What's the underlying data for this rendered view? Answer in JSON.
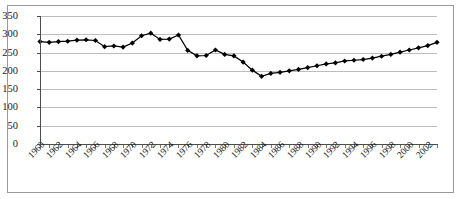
{
  "chart_data": {
    "type": "line",
    "title": "",
    "subtitle": "",
    "xlabel": "",
    "ylabel": "",
    "xlim": [
      1960,
      2003
    ],
    "ylim": [
      0,
      350
    ],
    "grid": true,
    "legend": false,
    "legend_position": "none",
    "marker": "diamond",
    "marker_color": "#000000",
    "line_color": "#000000",
    "ytick_labels": [
      "0",
      "50",
      "100",
      "150",
      "200",
      "250",
      "300",
      "350"
    ],
    "ytick_values": [
      0,
      50,
      100,
      150,
      200,
      250,
      300,
      350
    ],
    "xtick_labels": [
      "1960",
      "1962",
      "1964",
      "1966",
      "1968",
      "1970",
      "1972",
      "1974",
      "1976",
      "1978",
      "1980",
      "1982",
      "1984",
      "1986",
      "1988",
      "1990",
      "1992",
      "1994",
      "1996",
      "1998",
      "2000",
      "2002"
    ],
    "xtick_values": [
      1960,
      1962,
      1964,
      1966,
      1968,
      1970,
      1972,
      1974,
      1976,
      1978,
      1980,
      1982,
      1984,
      1986,
      1988,
      1990,
      1992,
      1994,
      1996,
      1998,
      2000,
      2002
    ],
    "x": [
      1960,
      1961,
      1962,
      1963,
      1964,
      1965,
      1966,
      1967,
      1968,
      1969,
      1970,
      1971,
      1972,
      1973,
      1974,
      1975,
      1976,
      1977,
      1978,
      1979,
      1980,
      1981,
      1982,
      1983,
      1984,
      1985,
      1986,
      1987,
      1988,
      1989,
      1990,
      1991,
      1992,
      1993,
      1994,
      1995,
      1996,
      1997,
      1998,
      1999,
      2000,
      2001,
      2002,
      2003
    ],
    "values": [
      280,
      278,
      280,
      281,
      284,
      285,
      283,
      266,
      268,
      265,
      276,
      296,
      303,
      286,
      287,
      298,
      256,
      241,
      242,
      257,
      245,
      241,
      224,
      202,
      185,
      193,
      196,
      200,
      204,
      209,
      214,
      219,
      222,
      227,
      229,
      231,
      235,
      240,
      245,
      251,
      257,
      263,
      269,
      278
    ]
  }
}
